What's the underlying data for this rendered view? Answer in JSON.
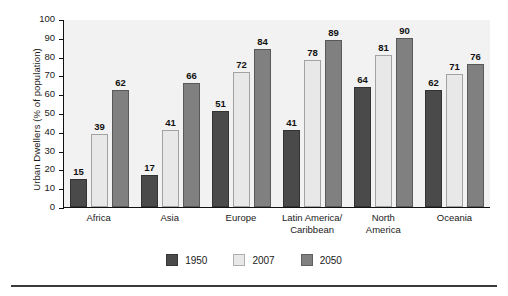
{
  "chart_data": {
    "type": "bar",
    "title": "",
    "subtitle": "",
    "xlabel": "",
    "ylabel": "Urban Dwellers (% of population)",
    "ylim": [
      0,
      100
    ],
    "ytick_step": 10,
    "yticks": [
      "100",
      "90",
      "80",
      "70",
      "60",
      "50",
      "40",
      "30",
      "20",
      "10",
      "0"
    ],
    "grid": false,
    "legend_position": "bottom-center",
    "categories": [
      "Africa",
      "Asia",
      "Europe",
      "Latin America/ Caribbean",
      "North America",
      "Oceania"
    ],
    "category_lines": [
      [
        "Africa"
      ],
      [
        "Asia"
      ],
      [
        "Europe"
      ],
      [
        "Latin America/",
        "Caribbean"
      ],
      [
        "North",
        "America"
      ],
      [
        "Oceania"
      ]
    ],
    "series": [
      {
        "name": "1950",
        "color": "#4a4a4a",
        "values": [
          15,
          17,
          51,
          41,
          64,
          62
        ]
      },
      {
        "name": "2007",
        "color": "#e8e8e8",
        "values": [
          39,
          41,
          72,
          78,
          81,
          71
        ]
      },
      {
        "name": "2050",
        "color": "#808080",
        "values": [
          62,
          66,
          84,
          89,
          90,
          76
        ]
      }
    ],
    "plot_background": "#f2f2f2",
    "axis_color": "#111111",
    "data_labels": true
  }
}
